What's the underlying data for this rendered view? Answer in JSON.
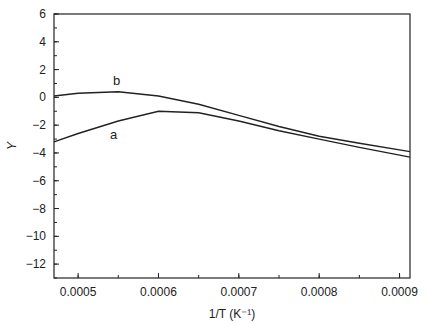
{
  "chart_data": {
    "type": "line",
    "title": "",
    "xlabel": "1/T (K^-1)",
    "ylabel": "Y",
    "xlim": [
      0.00047,
      0.000913
    ],
    "ylim": [
      -13,
      6
    ],
    "xticks": [
      "0.0005",
      "0.0006",
      "0.0007",
      "0.0008",
      "0.0009"
    ],
    "yticks": [
      "6",
      "4",
      "2",
      "0",
      "-2",
      "-4",
      "-6",
      "-8",
      "-10",
      "-12"
    ],
    "grid": false,
    "series": [
      {
        "name": "b",
        "x": [
          0.00047,
          0.0005,
          0.00055,
          0.0006,
          0.00065,
          0.0007,
          0.00075,
          0.0008,
          0.00085,
          0.000913
        ],
        "values": [
          0.1,
          0.3,
          0.4,
          0.1,
          -0.5,
          -1.3,
          -2.1,
          -2.8,
          -3.3,
          -3.9
        ]
      },
      {
        "name": "a",
        "x": [
          0.00047,
          0.0005,
          0.00055,
          0.0006,
          0.00065,
          0.0007,
          0.00075,
          0.0008,
          0.00085,
          0.000913
        ],
        "values": [
          -3.2,
          -2.6,
          -1.7,
          -1.0,
          -1.1,
          -1.7,
          -2.4,
          -3.0,
          -3.6,
          -4.3
        ]
      }
    ],
    "annotations": [
      "a",
      "b"
    ]
  }
}
